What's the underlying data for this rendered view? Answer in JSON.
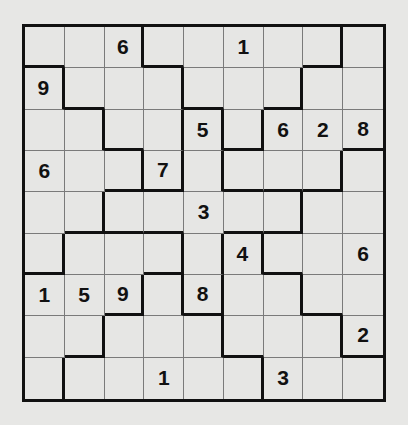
{
  "puzzle": {
    "type": "jigsaw-sudoku",
    "size": 9,
    "givens": [
      [
        "",
        "",
        "6",
        "",
        "",
        "1",
        "",
        "",
        ""
      ],
      [
        "9",
        "",
        "",
        "",
        "",
        "",
        "",
        "",
        ""
      ],
      [
        "",
        "",
        "",
        "",
        "5",
        "",
        "6",
        "2",
        "8"
      ],
      [
        "6",
        "",
        "",
        "7",
        "",
        "",
        "",
        "",
        ""
      ],
      [
        "",
        "",
        "",
        "",
        "3",
        "",
        "",
        "",
        ""
      ],
      [
        "",
        "",
        "",
        "",
        "",
        "4",
        "",
        "",
        "6"
      ],
      [
        "1",
        "5",
        "9",
        "",
        "8",
        "",
        "",
        "",
        ""
      ],
      [
        "",
        "",
        "",
        "",
        "",
        "",
        "",
        "",
        "2"
      ],
      [
        "",
        "",
        "",
        "1",
        "",
        "",
        "3",
        "",
        ""
      ]
    ],
    "regions": [
      [
        "A",
        "A",
        "A",
        "G",
        "G",
        "G",
        "G",
        "G",
        "H"
      ],
      [
        "B",
        "A",
        "A",
        "A",
        "G",
        "G",
        "G",
        "H",
        "H"
      ],
      [
        "B",
        "B",
        "A",
        "A",
        "C",
        "G",
        "H",
        "H",
        "H"
      ],
      [
        "B",
        "B",
        "B",
        "A",
        "C",
        "H",
        "H",
        "H",
        "I"
      ],
      [
        "B",
        "B",
        "C",
        "C",
        "C",
        "C",
        "C",
        "I",
        "I"
      ],
      [
        "B",
        "D",
        "D",
        "D",
        "C",
        "J",
        "I",
        "I",
        "I"
      ],
      [
        "D",
        "D",
        "D",
        "E",
        "C",
        "J",
        "J",
        "I",
        "I"
      ],
      [
        "D",
        "D",
        "E",
        "E",
        "E",
        "J",
        "J",
        "J",
        "I"
      ],
      [
        "D",
        "E",
        "E",
        "E",
        "E",
        "E",
        "J",
        "J",
        "J"
      ]
    ]
  },
  "colors": {
    "background": "#e7e7e5",
    "cell": "#e6e6e4",
    "thin_line": "#7a7a7a",
    "thick_line": "#111111",
    "digit": "#111111"
  }
}
